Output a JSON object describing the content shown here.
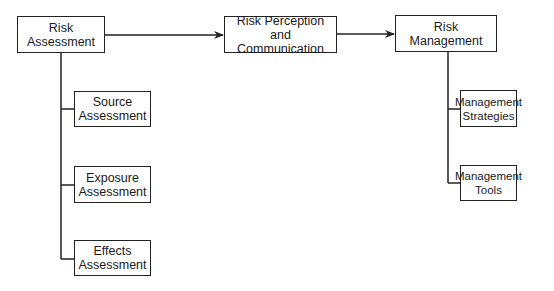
{
  "diagram": {
    "nodes": {
      "risk_assessment": {
        "label": "Risk\nAssessment"
      },
      "risk_perception": {
        "label": "Risk Perception\nand Communication"
      },
      "risk_management": {
        "label": "Risk\nManagement"
      },
      "source_assessment": {
        "label": "Source\nAssessment"
      },
      "exposure_assessment": {
        "label": "Exposure\nAssessment"
      },
      "effects_assessment": {
        "label": "Effects\nAssessment"
      },
      "management_strategies": {
        "label": "Management\nStrategies"
      },
      "management_tools": {
        "label": "Management\nTools"
      }
    },
    "edges": [
      {
        "from": "Risk Assessment",
        "to": "Risk Perception and Communication",
        "type": "arrow"
      },
      {
        "from": "Risk Perception and Communication",
        "to": "Risk Management",
        "type": "arrow"
      },
      {
        "from": "Risk Assessment",
        "to": "Source Assessment",
        "type": "branch"
      },
      {
        "from": "Risk Assessment",
        "to": "Exposure Assessment",
        "type": "branch"
      },
      {
        "from": "Risk Assessment",
        "to": "Effects Assessment",
        "type": "branch"
      },
      {
        "from": "Risk Management",
        "to": "Management Strategies",
        "type": "branch"
      },
      {
        "from": "Risk Management",
        "to": "Management Tools",
        "type": "branch"
      }
    ],
    "colors": {
      "line": "#222222",
      "background": "#ffffff"
    }
  }
}
